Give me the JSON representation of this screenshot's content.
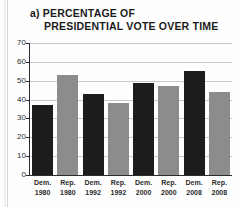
{
  "figure": {
    "label": "a)",
    "title_line_1": "a) PERCENTAGE OF",
    "title_line_2": "PRESIDENTIAL VOTE OVER TIME"
  },
  "colors": {
    "democrat_bar": "#1c1c1c",
    "republican_bar": "#8c8c8c",
    "gridline": "#c9c9c9",
    "axis": "#2c2c2c",
    "text": "#2b2b2b",
    "background": "#fefefe"
  },
  "chart_data": {
    "type": "bar",
    "title": "a) PERCENTAGE OF PRESIDENTIAL VOTE OVER TIME",
    "xlabel": "",
    "ylabel": "",
    "ylim": [
      0,
      70
    ],
    "yticks": [
      0,
      10,
      20,
      30,
      40,
      50,
      60,
      70
    ],
    "ytick_labels": [
      "0",
      "10",
      "20",
      "30",
      "40",
      "50",
      "60",
      "70"
    ],
    "grid": true,
    "legend": "none",
    "categories": [
      "Dem. 1980",
      "Rep. 1980",
      "Dem. 1992",
      "Rep. 1992",
      "Dem. 2000",
      "Rep. 2000",
      "Dem. 2008",
      "Rep. 2008"
    ],
    "category_party": [
      "Dem.",
      "Rep.",
      "Dem.",
      "Rep.",
      "Dem.",
      "Rep.",
      "Dem.",
      "Rep."
    ],
    "category_year": [
      "1980",
      "1980",
      "1992",
      "1992",
      "2000",
      "2000",
      "2008",
      "2008"
    ],
    "values": [
      37,
      53,
      43,
      38,
      49,
      47,
      55,
      44
    ],
    "bar_colors": [
      "#1c1c1c",
      "#8c8c8c",
      "#1c1c1c",
      "#8c8c8c",
      "#1c1c1c",
      "#8c8c8c",
      "#1c1c1c",
      "#8c8c8c"
    ]
  }
}
